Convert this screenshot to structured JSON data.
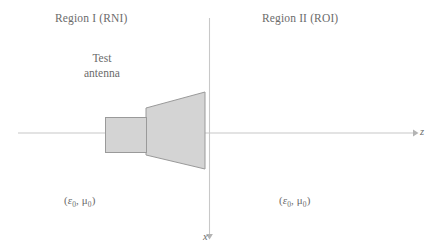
{
  "figure": {
    "regions": {
      "left": {
        "label": "Region I (RNI)"
      },
      "right": {
        "label": "Region II (ROI)"
      }
    },
    "antenna": {
      "caption_line1": "Test",
      "caption_line2": "antenna",
      "fill_color": "#d4d4d4",
      "stroke_color": "#9a9a9a"
    },
    "media": {
      "left": {
        "open": "(",
        "epsilon": "ε",
        "epsilon_sub": "0",
        "separator": ", ",
        "mu": "μ",
        "mu_sub": "0",
        "close": ")"
      },
      "right": {
        "open": "(",
        "epsilon": "ε",
        "epsilon_sub": "0",
        "separator": ", ",
        "mu": "μ",
        "mu_sub": "0",
        "close": ")"
      }
    },
    "axes": {
      "horizontal": {
        "label": "z"
      },
      "vertical": {
        "label": "x"
      },
      "line_color": "#c8c8c8"
    }
  }
}
